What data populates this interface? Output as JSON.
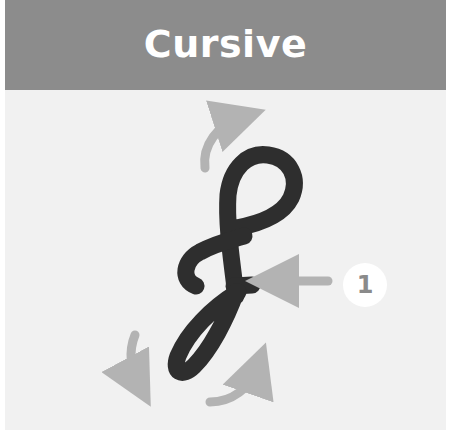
{
  "header": {
    "title": "Cursive"
  },
  "illustration": {
    "glyph": "cursive capital F",
    "glyph_color": "#2e2e2e",
    "arrow_color": "#b3b3b3",
    "arrows": [
      {
        "name": "top-arrow",
        "direction": "up-right"
      },
      {
        "name": "pointer-arrow",
        "direction": "left"
      },
      {
        "name": "bottom-left-arrow",
        "direction": "down"
      },
      {
        "name": "bottom-right-arrow",
        "direction": "up-right"
      }
    ]
  },
  "badge": {
    "number": "1"
  },
  "colors": {
    "header_bg": "#8c8c8c",
    "panel_bg": "#f1f1f1",
    "title_text": "#ffffff",
    "badge_bg": "#ffffff",
    "badge_text": "#8a8a8a"
  }
}
